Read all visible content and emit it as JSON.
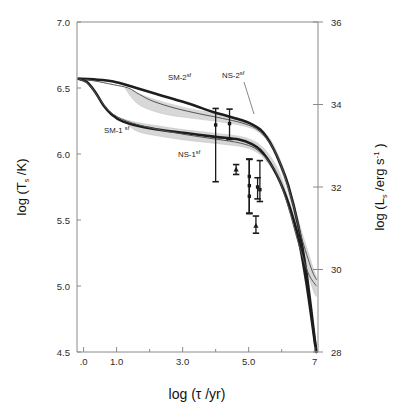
{
  "figure": {
    "kind": "neutron-star-cooling-curve",
    "background": "#ffffff",
    "ink": "#1a1a1a",
    "band_fill": "#c9c9c9",
    "band_fill_light": "#dedede"
  },
  "axes": {
    "left": {
      "title_parts": {
        "pre": "log (T",
        "sub": "s",
        "post": " /K)"
      },
      "title_plain": "log (Ts /K)",
      "ticks": [
        "7.0",
        "6.5",
        "6.0",
        "5.5",
        "5.0",
        "4.5"
      ],
      "tick_values": [
        7.0,
        6.5,
        6.0,
        5.5,
        5.0,
        4.5
      ],
      "range": [
        4.5,
        7.0
      ]
    },
    "right": {
      "title_parts": {
        "pre": "log (L",
        "sub": "s",
        "mid": " /erg  s",
        "sup": "-1",
        "post": " )"
      },
      "title_plain": "log (Ls /erg s^-1 )",
      "ticks": [
        "36",
        "34",
        "32",
        "30",
        "28"
      ],
      "tick_values": [
        36,
        34,
        32,
        30,
        28
      ],
      "range": [
        28,
        36
      ]
    },
    "bottom": {
      "title_parts": {
        "pre": "log (",
        "tau": "τ",
        "post": " /yr)"
      },
      "title_plain": "log ( tau /yr)",
      "ticks": [
        ".0",
        "1.0",
        "3.0",
        "5.0",
        "7"
      ],
      "tick_values": [
        0,
        1,
        3,
        5,
        7
      ],
      "range": [
        -0.2,
        7.1
      ]
    }
  },
  "curve_labels": [
    {
      "id": "sm-2sf",
      "base": "SM-2",
      "sup": "sf",
      "x": 168,
      "y": 80
    },
    {
      "id": "ns-2sf",
      "base": "NS-2",
      "sup": "sf",
      "x": 222,
      "y": 78
    },
    {
      "id": "sm-1sf",
      "base": "SM-1 ",
      "sup": "sf",
      "x": 104,
      "y": 133
    },
    {
      "id": "ns-1sf",
      "base": "NS-1",
      "sup": "sf",
      "x": 178,
      "y": 157
    }
  ],
  "chart_data": {
    "type": "line",
    "title": "",
    "xlabel": "log ( tau /yr)",
    "ylabel": "log (Ts /K)",
    "ylabel_right": "log (Ls /erg s^-1 )",
    "xlim": [
      -0.2,
      7.1
    ],
    "ylim": [
      4.5,
      7.0
    ],
    "ylim_right": [
      28,
      36
    ],
    "grid": false,
    "legend": "inline-annotations",
    "series": [
      {
        "name": "SM-2sf",
        "style": "thick-dark-upper",
        "points": [
          [
            -0.15,
            6.57
          ],
          [
            0.3,
            6.565
          ],
          [
            0.9,
            6.55
          ],
          [
            1.6,
            6.5
          ],
          [
            2.4,
            6.44
          ],
          [
            3.2,
            6.38
          ],
          [
            3.9,
            6.32
          ],
          [
            4.4,
            6.285
          ],
          [
            4.8,
            6.255
          ],
          [
            5.1,
            6.225
          ],
          [
            5.35,
            6.185
          ],
          [
            5.55,
            6.125
          ],
          [
            5.75,
            6.04
          ],
          [
            5.95,
            5.93
          ],
          [
            6.2,
            5.76
          ],
          [
            6.5,
            5.46
          ],
          [
            6.75,
            5.1
          ],
          [
            7.0,
            4.6
          ],
          [
            7.05,
            4.5
          ]
        ]
      },
      {
        "name": "NS-2sf",
        "style": "thin-band-upper",
        "points": [
          [
            -0.15,
            6.57
          ],
          [
            0.3,
            6.555
          ],
          [
            0.9,
            6.525
          ],
          [
            1.35,
            6.5
          ],
          [
            1.7,
            6.45
          ],
          [
            2.1,
            6.4
          ],
          [
            2.8,
            6.345
          ],
          [
            3.5,
            6.305
          ],
          [
            4.2,
            6.27
          ],
          [
            4.8,
            6.235
          ],
          [
            5.2,
            6.195
          ],
          [
            5.5,
            6.13
          ],
          [
            5.75,
            6.04
          ],
          [
            6.0,
            5.9
          ],
          [
            6.3,
            5.66
          ],
          [
            6.6,
            5.37
          ],
          [
            6.9,
            5.13
          ],
          [
            7.05,
            5.05
          ]
        ]
      },
      {
        "name": "SM-1sf",
        "style": "thick-dark-lower",
        "points": [
          [
            -0.15,
            6.57
          ],
          [
            0.1,
            6.545
          ],
          [
            0.35,
            6.47
          ],
          [
            0.6,
            6.37
          ],
          [
            0.85,
            6.3
          ],
          [
            1.2,
            6.245
          ],
          [
            1.7,
            6.21
          ],
          [
            2.4,
            6.18
          ],
          [
            3.2,
            6.155
          ],
          [
            4.0,
            6.13
          ],
          [
            4.7,
            6.11
          ],
          [
            5.1,
            6.075
          ],
          [
            5.35,
            6.03
          ],
          [
            5.55,
            5.97
          ],
          [
            5.75,
            5.89
          ],
          [
            5.95,
            5.79
          ],
          [
            6.2,
            5.63
          ],
          [
            6.5,
            5.37
          ],
          [
            6.75,
            5.02
          ],
          [
            7.0,
            4.58
          ],
          [
            7.05,
            4.5
          ]
        ]
      },
      {
        "name": "NS-1sf",
        "style": "thin-band-lower",
        "points": [
          [
            -0.15,
            6.57
          ],
          [
            0.15,
            6.53
          ],
          [
            0.45,
            6.43
          ],
          [
            0.8,
            6.32
          ],
          [
            1.3,
            6.25
          ],
          [
            2.0,
            6.2
          ],
          [
            2.9,
            6.155
          ],
          [
            3.8,
            6.12
          ],
          [
            4.6,
            6.09
          ],
          [
            5.1,
            6.055
          ],
          [
            5.4,
            6.0
          ],
          [
            5.65,
            5.93
          ],
          [
            5.9,
            5.82
          ],
          [
            6.2,
            5.6
          ],
          [
            6.5,
            5.33
          ],
          [
            6.8,
            5.1
          ],
          [
            7.05,
            5.0
          ]
        ]
      }
    ],
    "band_upper": {
      "name": "SM/NS-2sf uncertainty band",
      "top": [
        [
          1.25,
          6.5
        ],
        [
          1.7,
          6.455
        ],
        [
          2.2,
          6.41
        ],
        [
          3.0,
          6.355
        ],
        [
          3.8,
          6.315
        ],
        [
          4.6,
          6.275
        ],
        [
          5.2,
          6.22
        ],
        [
          5.6,
          6.13
        ],
        [
          5.9,
          5.99
        ],
        [
          6.2,
          5.78
        ],
        [
          6.55,
          5.46
        ],
        [
          6.9,
          5.18
        ],
        [
          7.05,
          5.07
        ]
      ],
      "bottom": [
        [
          1.25,
          6.5
        ],
        [
          1.55,
          6.4
        ],
        [
          1.9,
          6.345
        ],
        [
          2.5,
          6.3
        ],
        [
          3.3,
          6.27
        ],
        [
          4.1,
          6.245
        ],
        [
          4.9,
          6.21
        ],
        [
          5.3,
          6.165
        ],
        [
          5.6,
          6.09
        ],
        [
          5.85,
          5.97
        ],
        [
          6.15,
          5.75
        ],
        [
          6.5,
          5.43
        ],
        [
          6.85,
          5.13
        ],
        [
          7.05,
          5.0
        ]
      ]
    },
    "band_lower": {
      "name": "SM/NS-1sf uncertainty band",
      "top": [
        [
          1.15,
          6.27
        ],
        [
          1.5,
          6.245
        ],
        [
          2.2,
          6.215
        ],
        [
          3.0,
          6.185
        ],
        [
          3.9,
          6.16
        ],
        [
          4.7,
          6.135
        ],
        [
          5.15,
          6.1
        ],
        [
          5.45,
          6.045
        ],
        [
          5.7,
          5.965
        ],
        [
          5.95,
          5.85
        ],
        [
          6.25,
          5.62
        ],
        [
          6.6,
          5.31
        ],
        [
          6.95,
          5.04
        ],
        [
          7.05,
          4.99
        ]
      ],
      "bottom": [
        [
          1.15,
          6.27
        ],
        [
          1.6,
          6.175
        ],
        [
          2.3,
          6.135
        ],
        [
          3.1,
          6.105
        ],
        [
          4.0,
          6.08
        ],
        [
          4.8,
          6.055
        ],
        [
          5.2,
          6.02
        ],
        [
          5.45,
          5.97
        ],
        [
          5.7,
          5.89
        ],
        [
          5.95,
          5.78
        ],
        [
          6.25,
          5.55
        ],
        [
          6.6,
          5.24
        ],
        [
          6.95,
          4.97
        ],
        [
          7.05,
          4.92
        ]
      ]
    },
    "errorbars": [
      {
        "id": "eb1",
        "x": 4.0,
        "y": 6.22,
        "ylow": 5.79,
        "yhigh": 6.345,
        "cap": "both",
        "marker": "square"
      },
      {
        "id": "eb2",
        "x": 4.42,
        "y": 6.23,
        "ylow": 6.11,
        "yhigh": 6.34,
        "cap": "both",
        "marker": "square"
      },
      {
        "id": "eb3",
        "x": 4.62,
        "y": 5.885,
        "ylow": 5.845,
        "yhigh": 5.92,
        "cap": "both",
        "marker": "triangle"
      },
      {
        "id": "eb4",
        "x": 5.02,
        "y": 5.83,
        "ylow": 5.55,
        "yhigh": 5.96,
        "cap": "both",
        "marker": "square"
      },
      {
        "id": "eb5",
        "x": 5.02,
        "y": 5.76,
        "ylow": 5.55,
        "yhigh": 5.96,
        "cap": "both",
        "marker": "square"
      },
      {
        "id": "eb6",
        "x": 5.02,
        "y": 5.68,
        "ylow": 5.55,
        "yhigh": 5.96,
        "cap": "both",
        "marker": "square"
      },
      {
        "id": "eb7",
        "x": 5.27,
        "y": 5.75,
        "ylow": 5.66,
        "yhigh": 5.82,
        "cap": "both",
        "marker": "square"
      },
      {
        "id": "eb8",
        "x": 5.34,
        "y": 5.73,
        "ylow": 5.64,
        "yhigh": 5.95,
        "cap": "both",
        "marker": "square"
      },
      {
        "id": "eb9",
        "x": 5.22,
        "y": 5.46,
        "ylow": 5.4,
        "yhigh": 5.53,
        "cap": "both",
        "marker": "triangle"
      }
    ]
  }
}
